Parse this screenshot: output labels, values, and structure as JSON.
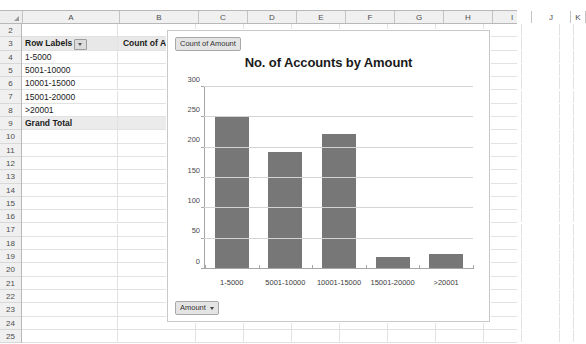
{
  "spreadsheet": {
    "columns": [
      "A",
      "B",
      "C",
      "D",
      "E",
      "F",
      "G",
      "H",
      "I",
      "J",
      "K"
    ],
    "rows": [
      "2",
      "3",
      "4",
      "5",
      "6",
      "7",
      "8",
      "9",
      "10",
      "11",
      "12",
      "13",
      "14",
      "15",
      "16",
      "17",
      "18",
      "19",
      "20",
      "21",
      "22",
      "23",
      "24",
      "25"
    ],
    "pivot": {
      "header": {
        "row_labels": "Row Labels",
        "value_field": "Count of Amount"
      },
      "items": [
        {
          "label": "1-5000",
          "value": "253"
        },
        {
          "label": "5001-10000",
          "value": "193"
        },
        {
          "label": "10001-15000",
          "value": "222"
        },
        {
          "label": "15001-20000",
          "value": "19"
        },
        {
          "label": ">20001",
          "value": "25"
        }
      ],
      "grand_total": {
        "label": "Grand Total",
        "value": "712"
      }
    }
  },
  "chart_panel": {
    "legend_button": "Count of Amount",
    "axis_button": "Amount"
  },
  "chart_data": {
    "type": "bar",
    "title": "No. of Accounts by Amount",
    "xlabel": "",
    "ylabel": "",
    "categories": [
      "1-5000",
      "5001-10000",
      "10001-15000",
      "15001-20000",
      ">20001"
    ],
    "values": [
      253,
      193,
      222,
      19,
      25
    ],
    "series": [
      {
        "name": "Count of Amount",
        "values": [
          253,
          193,
          222,
          19,
          25
        ]
      }
    ],
    "ylim": [
      0,
      300
    ],
    "yticks": [
      0,
      50,
      100,
      150,
      200,
      250,
      300
    ],
    "ytick_labels": [
      "0",
      "50",
      "100",
      "150",
      "200",
      "250",
      "300"
    ],
    "grid": true,
    "legend_position": "top-left",
    "bar_color": "#777777"
  }
}
